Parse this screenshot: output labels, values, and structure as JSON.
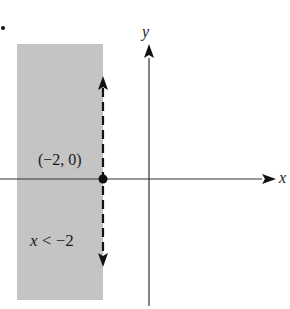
{
  "figure": {
    "marker": "bullet",
    "axes": {
      "x_label": "x",
      "y_label": "y"
    },
    "boundary": {
      "style": "dashed",
      "equation": "x = -2",
      "direction": "vertical"
    },
    "point": {
      "label": "(−2, 0)",
      "x": -2,
      "y": 0,
      "filled": true
    },
    "region": {
      "label": "x < −2",
      "inequality": "x < -2",
      "side": "left",
      "shaded": true
    },
    "colors": {
      "shading": "#c4c4c4",
      "axis": "#333333",
      "boundary": "#111111",
      "text": "#1a1a1a",
      "background": "#ffffff"
    }
  }
}
